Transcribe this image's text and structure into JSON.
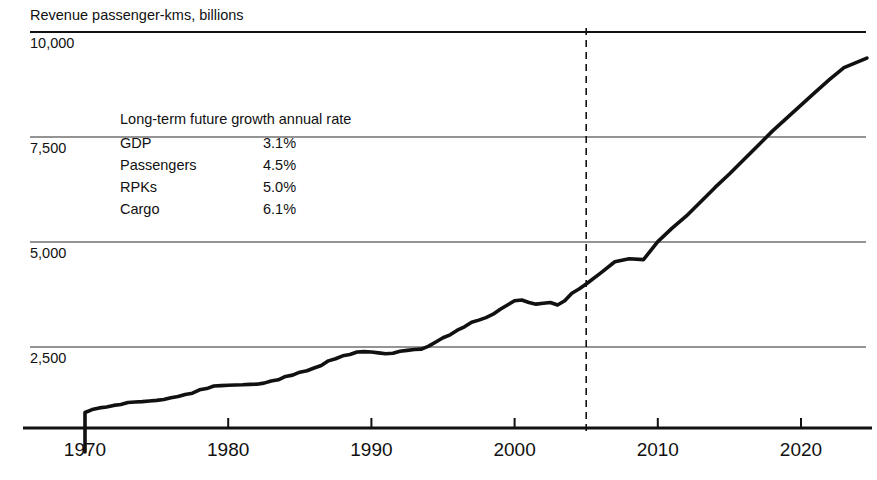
{
  "chart_data": {
    "type": "line",
    "title": "Revenue passenger-kms, billions",
    "xlabel": "",
    "ylabel": "",
    "ylim": [
      0,
      10500
    ],
    "xlim": [
      1967.2,
      2024.8
    ],
    "grid": true,
    "legend_position": "none",
    "y_ticks": [
      "2,500",
      "5,000",
      "7,500",
      "10,000"
    ],
    "y_tick_values": [
      2500,
      5000,
      7500,
      10000
    ],
    "x_ticks": [
      "1970",
      "1980",
      "1990",
      "2000",
      "2010",
      "2020"
    ],
    "x_tick_values": [
      1970,
      1980,
      1990,
      2000,
      2010,
      2020
    ],
    "forecast_start_year": 2005,
    "series": [
      {
        "name": "RPKs",
        "x": [
          1970,
          1970.5,
          1971,
          1971.5,
          1972,
          1972.5,
          1973,
          1973.5,
          1974,
          1974.5,
          1975,
          1975.5,
          1976,
          1976.5,
          1977,
          1977.5,
          1978,
          1978.5,
          1979,
          1979.5,
          1980,
          1980.5,
          1981,
          1981.5,
          1982,
          1982.5,
          1983,
          1983.5,
          1984,
          1984.5,
          1985,
          1985.5,
          1986,
          1986.5,
          1987,
          1987.5,
          1988,
          1988.5,
          1989,
          1989.5,
          1990,
          1990.5,
          1991,
          1991.5,
          1992,
          1992.5,
          1993,
          1993.5,
          1994,
          1994.5,
          1995,
          1995.5,
          1996,
          1996.5,
          1997,
          1997.5,
          1998,
          1998.5,
          1999,
          1999.5,
          2000,
          2000.5,
          2001,
          2001.5,
          2002,
          2002.5,
          2003,
          2003.5,
          2004,
          2004.5,
          2005,
          2006,
          2007,
          2008,
          2009,
          2010,
          2011,
          2012,
          2013,
          2014,
          2015,
          2016,
          2017,
          2018,
          2019,
          2020,
          2021,
          2022,
          2023,
          2024.6
        ],
        "values": [
          940,
          1010,
          1050,
          1070,
          1110,
          1130,
          1180,
          1190,
          1200,
          1215,
          1230,
          1250,
          1290,
          1320,
          1370,
          1400,
          1480,
          1510,
          1570,
          1580,
          1590,
          1595,
          1600,
          1610,
          1615,
          1640,
          1690,
          1720,
          1800,
          1830,
          1900,
          1935,
          2000,
          2060,
          2170,
          2220,
          2290,
          2320,
          2380,
          2390,
          2380,
          2360,
          2340,
          2350,
          2400,
          2420,
          2440,
          2450,
          2520,
          2620,
          2720,
          2790,
          2900,
          2980,
          3090,
          3140,
          3200,
          3280,
          3400,
          3500,
          3600,
          3620,
          3560,
          3520,
          3540,
          3560,
          3500,
          3600,
          3780,
          3880,
          4000,
          4260,
          4530,
          4600,
          4580,
          5010,
          5330,
          5620,
          5960,
          6300,
          6620,
          6960,
          7300,
          7640,
          7950,
          8260,
          8570,
          8870,
          9150,
          9380
        ]
      }
    ],
    "annotations": {
      "legend_table": {
        "heading": "Long-term future growth annual rate",
        "rows": [
          {
            "label": "GDP",
            "value": "3.1%"
          },
          {
            "label": "Passengers",
            "value": "4.5%"
          },
          {
            "label": "RPKs",
            "value": "5.0%"
          },
          {
            "label": "Cargo",
            "value": "6.1%"
          }
        ]
      }
    }
  },
  "colors": {
    "series": "#111111",
    "grid": "#2b2b2b",
    "axis": "#111111",
    "background": "#ffffff"
  }
}
